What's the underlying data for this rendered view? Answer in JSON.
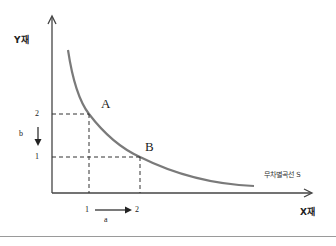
{
  "diagram": {
    "axes": {
      "y_label": "Y재",
      "x_label": "X재"
    },
    "curve": {
      "label": "무차별곡선 S",
      "color": "#7a7a7a"
    },
    "points": [
      {
        "name": "A",
        "x": 1,
        "y": 2
      },
      {
        "name": "B",
        "x": 2,
        "y": 1
      }
    ],
    "y_ticks": [
      "2",
      "1"
    ],
    "x_ticks": [
      "1",
      "2"
    ],
    "y_change_label": "b",
    "x_change_label": "a"
  }
}
